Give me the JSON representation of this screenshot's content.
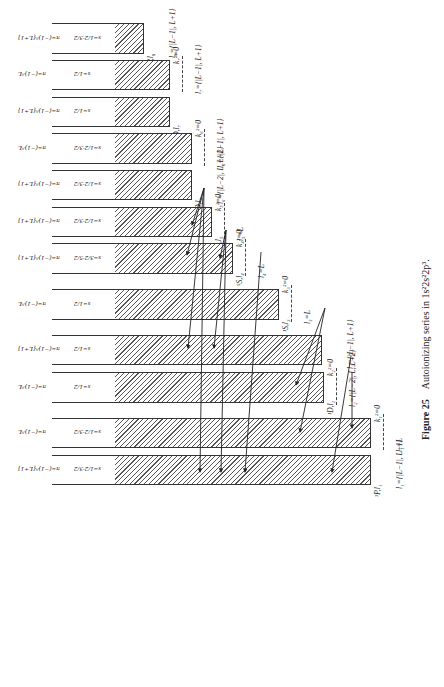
{
  "figure": {
    "number_label": "Figure 25",
    "caption": "Autoionizing series in 1s²2s²2p³."
  },
  "bands": [
    {
      "top": 23,
      "bottom": 52,
      "edge": 144,
      "parity": "π=(−1)^{L+1}",
      "spin": "s=1/2·3/2",
      "level": "³P,l₈",
      "k": "",
      "l": "l₈={|L−1|, L+1}"
    },
    {
      "top": 60,
      "bottom": 88,
      "edge": 170,
      "parity": "π=(−1)^L",
      "spin": "s=1/2",
      "level": "",
      "k": "k₇²=0",
      "l": "l₇={|L−1|, L+1}"
    },
    {
      "top": 97,
      "bottom": 125,
      "edge": 170,
      "parity": "π=(−1)^{L+1}",
      "spin": "s=1/2",
      "level": "¹D,l₇",
      "k": "",
      "l": ""
    },
    {
      "top": 133,
      "bottom": 162,
      "edge": 192,
      "parity": "π=(−1)^L",
      "spin": "s=1/2·3/2",
      "level": "",
      "k": "k₆²=0",
      "l": "l₆={|L−1|, L+1}"
    },
    {
      "top": 170,
      "bottom": 198,
      "edge": 192,
      "parity": "π=(−1)^{L+1}",
      "spin": "s=1/2·3/2",
      "level": "³D,l₆",
      "k": "",
      "l": "l₆={|L−2|, L, L+2}"
    },
    {
      "top": 207,
      "bottom": 235,
      "edge": 212,
      "parity": "π=(−1)^{L+1}",
      "spin": "s=1/2·3/2",
      "level": "³S,l₅",
      "k": "k₅²=0",
      "l": "l₅=L"
    },
    {
      "top": 243,
      "bottom": 272,
      "edge": 233,
      "parity": "π=(−1)^{L+1}",
      "spin": "s=3/2·5/2",
      "level": "⁵S,l₄",
      "k": "k₄²=0",
      "l": "l₄=L"
    },
    {
      "top": 289,
      "bottom": 318,
      "edge": 279,
      "parity": "π=(−1)^L",
      "spin": "s=1/2",
      "level": "¹S,l₃",
      "k": "k₃²=0",
      "l": "l₃=L"
    },
    {
      "top": 335,
      "bottom": 363,
      "edge": 322,
      "parity": "π=(−1)^{L+1}",
      "spin": "s=1/2",
      "level": "",
      "k": "",
      "l": "l₂={|L−1|, L+1}"
    },
    {
      "top": 372,
      "bottom": 401,
      "edge": 324,
      "parity": "π=(−1)^L",
      "spin": "s=1/2",
      "level": "¹D,l₂",
      "k": "k₂²=0",
      "l": "l₂={|L−2|, L, L+2}"
    },
    {
      "top": 418,
      "bottom": 446,
      "edge": 371,
      "parity": "π=(−1)^L",
      "spin": "s=1/2·3/2",
      "level": "",
      "k": "k₁²=0",
      "l": "l₁=L"
    },
    {
      "top": 455,
      "bottom": 483,
      "edge": 371,
      "parity": "π=(−1)^{L+1}",
      "spin": "s=1/2·3/2",
      "level": "³P,l₁",
      "k": "",
      "l": "l₁={|L−1|, L+1}"
    }
  ]
}
